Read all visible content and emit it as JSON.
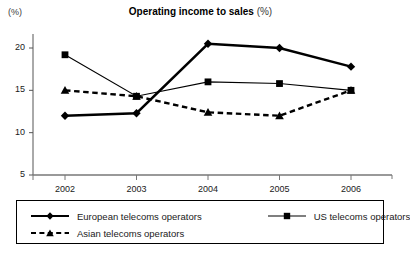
{
  "chart_data": {
    "type": "line",
    "title": "Operating income to sales",
    "title_suffix": "(%)",
    "unit_label": "(%)",
    "xlabel": "",
    "ylabel": "",
    "categories": [
      "2002",
      "2003",
      "2004",
      "2005",
      "2006"
    ],
    "ylim": [
      5,
      22
    ],
    "yticks": [
      5,
      10,
      15,
      20
    ],
    "ytick_labels": [
      "5",
      "10",
      "15",
      "20"
    ],
    "grid": false,
    "legend_position": "below",
    "series": [
      {
        "name": "European telecoms operators",
        "marker": "diamond",
        "line_style": "solid",
        "line_width": "thick",
        "color": "#000000",
        "values": [
          12.0,
          12.3,
          20.5,
          20.0,
          17.8
        ]
      },
      {
        "name": "US telecoms operators",
        "marker": "square",
        "line_style": "solid",
        "line_width": "thin",
        "color": "#000000",
        "values": [
          19.2,
          14.3,
          16.0,
          15.8,
          15.0
        ]
      },
      {
        "name": "Asian telecoms operators",
        "marker": "triangle",
        "line_style": "dashed",
        "line_width": "thick",
        "color": "#000000",
        "values": [
          15.0,
          14.3,
          12.4,
          12.0,
          15.0
        ]
      }
    ]
  },
  "legend": {
    "items": [
      {
        "label": "European telecoms operators"
      },
      {
        "label": "US telecoms operators"
      },
      {
        "label": "Asian telecoms operators"
      }
    ]
  }
}
